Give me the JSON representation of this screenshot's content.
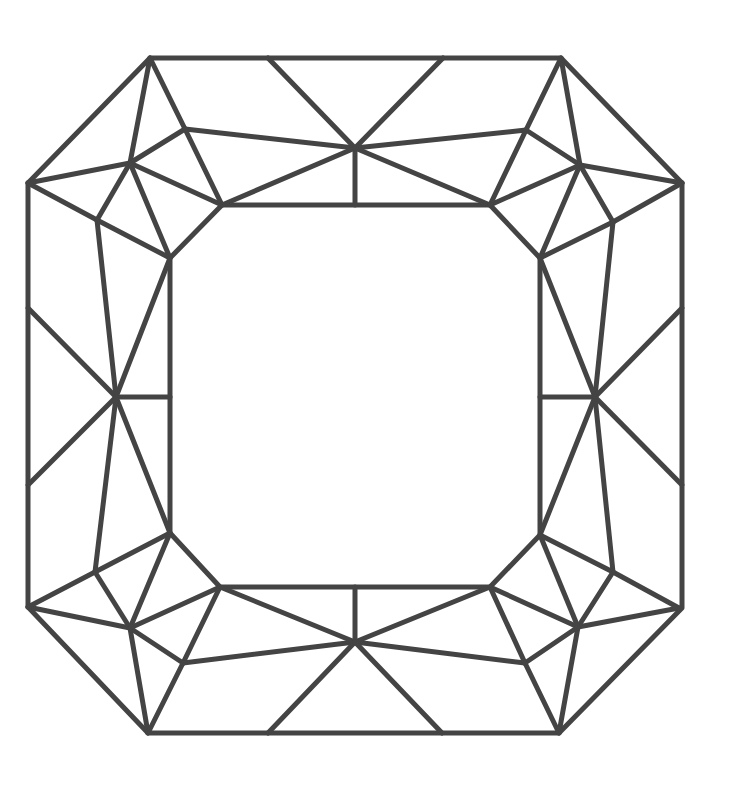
{
  "diagram": {
    "style": {
      "stroke_color": "#444444",
      "stroke_width": 5,
      "background": "#ffffff"
    },
    "outline": [
      [
        150,
        58
      ],
      [
        561,
        58
      ],
      [
        682,
        183
      ],
      [
        682,
        608
      ],
      [
        559,
        733
      ],
      [
        148,
        733
      ],
      [
        28,
        607
      ],
      [
        28,
        183
      ]
    ],
    "table": [
      [
        222,
        205
      ],
      [
        490,
        205
      ],
      [
        540,
        258
      ],
      [
        540,
        535
      ],
      [
        490,
        587
      ],
      [
        220,
        587
      ],
      [
        170,
        533
      ],
      [
        170,
        258
      ]
    ],
    "points": {
      "M_top": [
        355,
        148
      ],
      "M_bot": [
        355,
        642
      ],
      "L": [
        116,
        397
      ],
      "R": [
        595,
        397
      ],
      "A_tl": [
        130,
        163
      ],
      "B_tl": [
        185,
        129
      ],
      "D_tl": [
        97,
        220
      ],
      "A_tr": [
        580,
        165
      ],
      "B_tr": [
        526,
        130
      ],
      "D_tr": [
        613,
        222
      ],
      "A_bl": [
        130,
        628
      ],
      "B_bl": [
        183,
        663
      ],
      "D_bl": [
        95,
        572
      ],
      "A_br": [
        578,
        627
      ],
      "B_br": [
        525,
        663
      ],
      "D_br": [
        613,
        572
      ]
    },
    "edges": [
      [
        [
          150,
          58
        ],
        [
          130,
          163
        ]
      ],
      [
        [
          150,
          58
        ],
        [
          185,
          129
        ]
      ],
      [
        [
          28,
          183
        ],
        [
          130,
          163
        ]
      ],
      [
        [
          28,
          183
        ],
        [
          97,
          220
        ]
      ],
      [
        [
          130,
          163
        ],
        [
          185,
          129
        ]
      ],
      [
        [
          130,
          163
        ],
        [
          97,
          220
        ]
      ],
      [
        [
          130,
          163
        ],
        [
          222,
          205
        ]
      ],
      [
        [
          130,
          163
        ],
        [
          170,
          258
        ]
      ],
      [
        [
          185,
          129
        ],
        [
          222,
          205
        ]
      ],
      [
        [
          185,
          129
        ],
        [
          355,
          148
        ]
      ],
      [
        [
          97,
          220
        ],
        [
          170,
          258
        ]
      ],
      [
        [
          97,
          220
        ],
        [
          116,
          397
        ]
      ],
      [
        [
          222,
          205
        ],
        [
          355,
          148
        ]
      ],
      [
        [
          268,
          58
        ],
        [
          355,
          148
        ]
      ],
      [
        [
          443,
          58
        ],
        [
          355,
          148
        ]
      ],
      [
        [
          355,
          148
        ],
        [
          355,
          205
        ]
      ],
      [
        [
          490,
          205
        ],
        [
          355,
          148
        ]
      ],
      [
        [
          526,
          130
        ],
        [
          355,
          148
        ]
      ],
      [
        [
          561,
          58
        ],
        [
          580,
          165
        ]
      ],
      [
        [
          561,
          58
        ],
        [
          526,
          130
        ]
      ],
      [
        [
          682,
          183
        ],
        [
          580,
          165
        ]
      ],
      [
        [
          682,
          183
        ],
        [
          613,
          222
        ]
      ],
      [
        [
          580,
          165
        ],
        [
          526,
          130
        ]
      ],
      [
        [
          580,
          165
        ],
        [
          613,
          222
        ]
      ],
      [
        [
          580,
          165
        ],
        [
          490,
          205
        ]
      ],
      [
        [
          580,
          165
        ],
        [
          540,
          258
        ]
      ],
      [
        [
          526,
          130
        ],
        [
          490,
          205
        ]
      ],
      [
        [
          613,
          222
        ],
        [
          540,
          258
        ]
      ],
      [
        [
          613,
          222
        ],
        [
          595,
          397
        ]
      ],
      [
        [
          28,
          308
        ],
        [
          116,
          397
        ]
      ],
      [
        [
          28,
          485
        ],
        [
          116,
          397
        ]
      ],
      [
        [
          116,
          397
        ],
        [
          170,
          258
        ]
      ],
      [
        [
          116,
          397
        ],
        [
          170,
          533
        ]
      ],
      [
        [
          116,
          397
        ],
        [
          170,
          397
        ]
      ],
      [
        [
          116,
          397
        ],
        [
          95,
          572
        ]
      ],
      [
        [
          682,
          308
        ],
        [
          595,
          397
        ]
      ],
      [
        [
          682,
          485
        ],
        [
          595,
          397
        ]
      ],
      [
        [
          595,
          397
        ],
        [
          540,
          258
        ]
      ],
      [
        [
          595,
          397
        ],
        [
          540,
          535
        ]
      ],
      [
        [
          595,
          397
        ],
        [
          540,
          397
        ]
      ],
      [
        [
          595,
          397
        ],
        [
          613,
          572
        ]
      ],
      [
        [
          28,
          607
        ],
        [
          130,
          628
        ]
      ],
      [
        [
          28,
          607
        ],
        [
          95,
          572
        ]
      ],
      [
        [
          148,
          733
        ],
        [
          130,
          628
        ]
      ],
      [
        [
          148,
          733
        ],
        [
          183,
          663
        ]
      ],
      [
        [
          130,
          628
        ],
        [
          95,
          572
        ]
      ],
      [
        [
          130,
          628
        ],
        [
          183,
          663
        ]
      ],
      [
        [
          130,
          628
        ],
        [
          220,
          587
        ]
      ],
      [
        [
          130,
          628
        ],
        [
          170,
          533
        ]
      ],
      [
        [
          95,
          572
        ],
        [
          170,
          533
        ]
      ],
      [
        [
          183,
          663
        ],
        [
          220,
          587
        ]
      ],
      [
        [
          183,
          663
        ],
        [
          355,
          642
        ]
      ],
      [
        [
          220,
          587
        ],
        [
          355,
          642
        ]
      ],
      [
        [
          268,
          733
        ],
        [
          355,
          642
        ]
      ],
      [
        [
          442,
          733
        ],
        [
          355,
          642
        ]
      ],
      [
        [
          355,
          642
        ],
        [
          355,
          587
        ]
      ],
      [
        [
          490,
          587
        ],
        [
          355,
          642
        ]
      ],
      [
        [
          525,
          663
        ],
        [
          355,
          642
        ]
      ],
      [
        [
          679,
          608
        ],
        [
          578,
          627
        ]
      ],
      [
        [
          679,
          608
        ],
        [
          613,
          572
        ]
      ],
      [
        [
          559,
          733
        ],
        [
          578,
          627
        ]
      ],
      [
        [
          559,
          733
        ],
        [
          525,
          663
        ]
      ],
      [
        [
          578,
          627
        ],
        [
          613,
          572
        ]
      ],
      [
        [
          578,
          627
        ],
        [
          525,
          663
        ]
      ],
      [
        [
          578,
          627
        ],
        [
          490,
          587
        ]
      ],
      [
        [
          578,
          627
        ],
        [
          540,
          535
        ]
      ],
      [
        [
          613,
          572
        ],
        [
          540,
          535
        ]
      ],
      [
        [
          525,
          663
        ],
        [
          490,
          587
        ]
      ]
    ]
  }
}
